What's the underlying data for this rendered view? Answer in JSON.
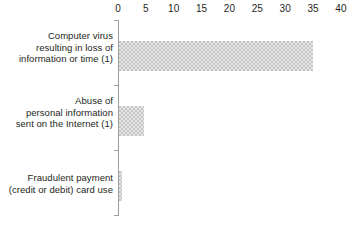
{
  "chart_data": {
    "type": "bar",
    "orientation": "horizontal",
    "title": "",
    "subtitle": "",
    "xlabel": "",
    "ylabel": "",
    "categories": [
      "Computer virus resulting in loss of information or time (1)",
      "Abuse of personal information sent on the Internet (1)",
      "Fraudulent payment (credit or debit) card use"
    ],
    "values": [
      34.8,
      4.5,
      0.6
    ],
    "xlim": [
      0,
      40
    ],
    "xticks": [
      0,
      5,
      10,
      15,
      20,
      25,
      30,
      35,
      40
    ],
    "xtick_labels": [
      "0",
      "5",
      "10",
      "15",
      "20",
      "25",
      "30",
      "35",
      "40"
    ],
    "axis_position": "top",
    "grid": false,
    "legend": "none",
    "bar_color": "#c6c6c6",
    "bar_pattern": "fine-checker",
    "axis_color": "#9d9d9d",
    "text_color": "#231f20",
    "background": "#ffffff"
  },
  "categories_wrapped": [
    [
      "Computer virus",
      "resulting in loss of",
      "information or time (1)"
    ],
    [
      "Abuse of",
      "personal information",
      "sent on the Internet (1)"
    ],
    [
      "Fraudulent payment",
      "(credit or debit) card use"
    ]
  ]
}
